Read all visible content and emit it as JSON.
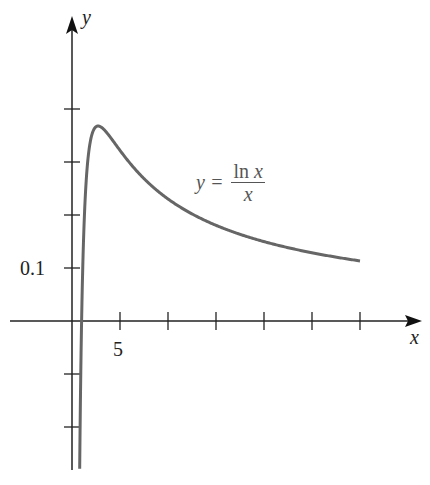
{
  "chart_data": {
    "type": "line",
    "title": "",
    "xlabel": "x",
    "ylabel": "y",
    "function": "y = ln x / x",
    "annotation": {
      "lhs": "y =",
      "numerator": "ln x",
      "denominator": "x"
    },
    "x_tick_labels": [
      {
        "value": 5,
        "label": "5"
      }
    ],
    "x_ticks": [
      5,
      10,
      15,
      20,
      25,
      30
    ],
    "y_tick_labels": [
      {
        "value": 0.1,
        "label": "0.1"
      }
    ],
    "y_ticks": [
      -0.2,
      -0.1,
      0.1,
      0.2,
      0.3,
      0.4
    ],
    "xlim": [
      -6.5,
      36
    ],
    "ylim": [
      -0.3,
      0.57
    ],
    "grid": false,
    "legend": "none",
    "series": [
      {
        "name": "ln x / x",
        "color": "#666666",
        "x_range": [
          0.8,
          30
        ],
        "peak": {
          "x": 2.718,
          "y": 0.368
        }
      }
    ]
  },
  "labels": {
    "x_axis": "x",
    "y_axis": "y",
    "tick_5": "5",
    "tick_01": "0.1",
    "eq_lhs": "y =",
    "eq_num_ln": "ln ",
    "eq_num_x": "x",
    "eq_den": "x"
  }
}
